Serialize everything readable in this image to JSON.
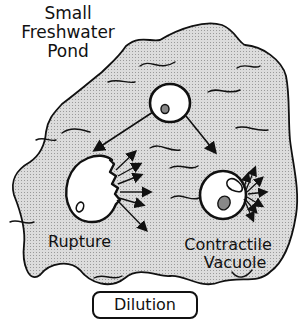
{
  "diagram": {
    "title_lines": [
      "Small",
      "Freshwater",
      "Pond"
    ],
    "labels": {
      "rupture": "Rupture",
      "contractile_line1": "Contractile",
      "contractile_line2": "Vacuole",
      "dilution": "Dilution"
    },
    "colors": {
      "pond_fill": "#d4d4d4",
      "outline": "#111111",
      "background": "#ffffff"
    },
    "elements": [
      "pond",
      "central-cell",
      "ruptured-cell",
      "cell-with-contractile-vacuole",
      "arrows"
    ]
  }
}
